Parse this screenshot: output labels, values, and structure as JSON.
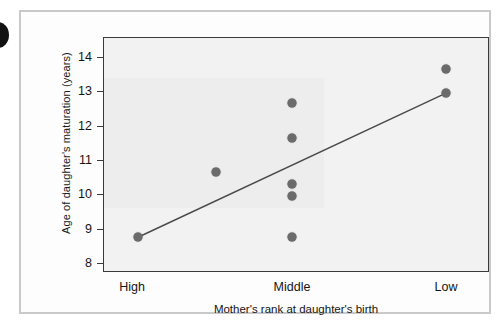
{
  "figure": {
    "edge_glyph": "partial-dark-circle",
    "frame_color": "#c9c9c9",
    "plot_bg": "#f2f2f2",
    "point_color": "#6b6b6b",
    "line_color": "#4a4a4a"
  },
  "chart_data": {
    "type": "scatter",
    "title": "",
    "xlabel": "Mother's rank at daughter's birth",
    "ylabel": "Age of daughter's maturation (years)",
    "categories": [
      "High",
      "Middle",
      "Low"
    ],
    "category_x": [
      110,
      270,
      424
    ],
    "ylim": [
      8,
      14
    ],
    "yticks": [
      8,
      9,
      10,
      11,
      12,
      13,
      14
    ],
    "ytick_labels": [
      "8",
      "9",
      "10",
      "11",
      "12",
      "13",
      "14"
    ],
    "grid": false,
    "legend": null,
    "points": [
      {
        "category": "High",
        "x_px": 116,
        "y": 8.75
      },
      {
        "category": "High",
        "x_px": 194,
        "y": 10.65
      },
      {
        "category": "Middle",
        "x_px": 270,
        "y": 12.65
      },
      {
        "category": "Middle",
        "x_px": 270,
        "y": 11.65
      },
      {
        "category": "Middle",
        "x_px": 270,
        "y": 10.3
      },
      {
        "category": "Middle",
        "x_px": 270,
        "y": 9.95
      },
      {
        "category": "Middle",
        "x_px": 270,
        "y": 8.75
      },
      {
        "category": "Low",
        "x_px": 424,
        "y": 13.65
      },
      {
        "category": "Low",
        "x_px": 424,
        "y": 12.95
      }
    ],
    "trend_line": {
      "x_start_px": 116,
      "y_start": 8.75,
      "x_end_px": 424,
      "y_end": 12.95
    }
  }
}
